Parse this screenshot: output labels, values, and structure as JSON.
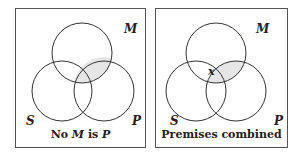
{
  "panels": [
    {
      "id": "left",
      "labels": {
        "M": "M",
        "S": "S",
        "P": "P"
      },
      "caption_parts": [
        "No ",
        "M",
        " is ",
        "P"
      ],
      "shaded_region": "M∩P",
      "mark": null
    },
    {
      "id": "right",
      "labels": {
        "M": "M",
        "S": "S",
        "P": "P"
      },
      "caption": "Premises combined",
      "shaded_region": "M∩P",
      "mark": "x"
    }
  ],
  "colors": {
    "line": "#333333",
    "shade": "#e6e6e6",
    "border": "#555555"
  }
}
